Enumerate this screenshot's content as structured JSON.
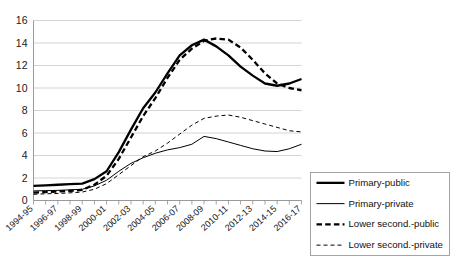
{
  "chart_data": {
    "type": "line",
    "title": "",
    "subtitle": "",
    "xlabel": "",
    "ylabel": "",
    "ylim": [
      0,
      16
    ],
    "ytick_step": 2,
    "yticks": [
      "0",
      "2",
      "4",
      "6",
      "8",
      "10",
      "12",
      "14",
      "16"
    ],
    "grid": true,
    "legend_position": "bottom-right",
    "x": [
      "1994-95",
      "1995-96",
      "1996-97",
      "1997-98",
      "1998-99",
      "1999-00",
      "2000-01",
      "2001-02",
      "2002-03",
      "2003-04",
      "2004-05",
      "2005-06",
      "2006-07",
      "2007-08",
      "2008-09",
      "2009-10",
      "2010-11",
      "2011-12",
      "2012-13",
      "2013-14",
      "2014-15",
      "2015-16",
      "2016-17"
    ],
    "xtick_labels": [
      "1994-95",
      "1996-97",
      "1998-99",
      "2000-01",
      "2002-03",
      "2004-05",
      "2006-07",
      "2008-09",
      "2010-11",
      "2012-13",
      "2014-15",
      "2016-17"
    ],
    "series": [
      {
        "name": "Primary-public",
        "style": "solid",
        "width": "thick",
        "color": "#000000",
        "values": [
          1.3,
          1.35,
          1.4,
          1.45,
          1.5,
          1.9,
          2.6,
          4.3,
          6.3,
          8.2,
          9.6,
          11.3,
          12.9,
          13.8,
          14.3,
          13.7,
          12.9,
          11.9,
          11.1,
          10.4,
          10.2,
          10.4,
          10.8
        ]
      },
      {
        "name": "Primary-private",
        "style": "solid",
        "width": "thin",
        "color": "#000000",
        "values": [
          0.85,
          0.88,
          0.9,
          0.95,
          1.0,
          1.3,
          1.8,
          2.6,
          3.3,
          3.8,
          4.2,
          4.5,
          4.7,
          5.0,
          5.7,
          5.5,
          5.2,
          4.9,
          4.6,
          4.4,
          4.35,
          4.6,
          5.0
        ]
      },
      {
        "name": "Lower second.-public",
        "style": "dashed",
        "width": "thick",
        "color": "#000000",
        "values": [
          0.7,
          0.75,
          0.8,
          0.85,
          0.95,
          1.4,
          2.2,
          3.7,
          5.6,
          7.5,
          9.1,
          10.9,
          12.5,
          13.5,
          14.2,
          14.4,
          14.3,
          13.6,
          12.5,
          11.3,
          10.4,
          10.0,
          9.8
        ]
      },
      {
        "name": "Lower second.-private",
        "style": "dashed",
        "width": "thin",
        "color": "#000000",
        "values": [
          0.55,
          0.6,
          0.62,
          0.68,
          0.75,
          1.0,
          1.5,
          2.3,
          3.1,
          3.9,
          4.4,
          5.1,
          5.9,
          6.7,
          7.3,
          7.5,
          7.6,
          7.4,
          7.1,
          6.8,
          6.5,
          6.2,
          6.1
        ]
      }
    ],
    "legend_entries": [
      {
        "label": "Primary-public",
        "style": "solid",
        "width": "thick"
      },
      {
        "label": "Primary-private",
        "style": "solid",
        "width": "thin"
      },
      {
        "label": "Lower second.-public",
        "style": "dashed",
        "width": "thick"
      },
      {
        "label": "Lower second.-private",
        "style": "dashed",
        "width": "thin"
      }
    ]
  }
}
